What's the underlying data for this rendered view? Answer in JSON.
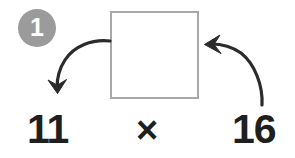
{
  "diagram": {
    "kind": "math-worksheet-step",
    "background_color": "#ffffff",
    "step_badge": {
      "label": "1",
      "fill_color": "#9b9b9b",
      "text_color": "#ffffff",
      "shape": "circle"
    },
    "answer_box": {
      "value": "",
      "placeholder": "",
      "border_color": "#a8a8a8",
      "fill_color": "#ffffff",
      "shape": "square"
    },
    "equation": {
      "left_operand": "11",
      "operator": "×",
      "right_operand": "16",
      "text_color": "#1f1f1f"
    },
    "arrows": [
      {
        "name": "arrow-box-to-left-operand",
        "from": "answer-box-left-edge",
        "to": "left-operand",
        "direction": "down-left",
        "head": "down",
        "color": "#2b2b2b"
      },
      {
        "name": "arrow-right-operand-to-box",
        "from": "right-operand",
        "to": "answer-box-right-edge",
        "direction": "up-left",
        "head": "left",
        "color": "#2b2b2b"
      }
    ]
  }
}
